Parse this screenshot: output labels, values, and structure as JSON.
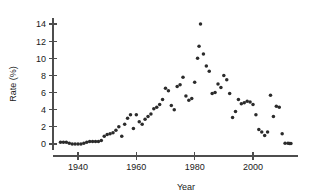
{
  "chart_data": {
    "type": "scatter",
    "title": "",
    "xlabel": "Year",
    "ylabel": "Rate (%)",
    "xlim": [
      1932,
      2014
    ],
    "ylim": [
      -0.6,
      14.6
    ],
    "xticks": [
      1940,
      1960,
      1980,
      2000
    ],
    "yticks": [
      0,
      2,
      4,
      6,
      8,
      10,
      12,
      14
    ],
    "grid": false,
    "legend": null,
    "marker": "filled-circle",
    "marker_color": "#2b2b2b",
    "series": [
      {
        "name": "Rate",
        "points": [
          [
            1934,
            0.2
          ],
          [
            1935,
            0.2
          ],
          [
            1936,
            0.2
          ],
          [
            1937,
            0.1
          ],
          [
            1938,
            0.0
          ],
          [
            1939,
            0.0
          ],
          [
            1940,
            0.0
          ],
          [
            1941,
            0.0
          ],
          [
            1942,
            0.1
          ],
          [
            1943,
            0.2
          ],
          [
            1944,
            0.3
          ],
          [
            1945,
            0.3
          ],
          [
            1946,
            0.3
          ],
          [
            1947,
            0.3
          ],
          [
            1948,
            0.4
          ],
          [
            1949,
            0.9
          ],
          [
            1950,
            1.1
          ],
          [
            1951,
            1.2
          ],
          [
            1952,
            1.3
          ],
          [
            1953,
            1.6
          ],
          [
            1954,
            2.0
          ],
          [
            1955,
            0.9
          ],
          [
            1956,
            2.3
          ],
          [
            1957,
            3.0
          ],
          [
            1958,
            3.4
          ],
          [
            1959,
            1.8
          ],
          [
            1960,
            3.4
          ],
          [
            1961,
            2.6
          ],
          [
            1962,
            2.3
          ],
          [
            1963,
            2.9
          ],
          [
            1964,
            3.2
          ],
          [
            1965,
            3.5
          ],
          [
            1966,
            4.1
          ],
          [
            1967,
            4.3
          ],
          [
            1968,
            4.6
          ],
          [
            1969,
            5.2
          ],
          [
            1970,
            6.5
          ],
          [
            1971,
            6.2
          ],
          [
            1972,
            4.5
          ],
          [
            1973,
            4.0
          ],
          [
            1974,
            6.7
          ],
          [
            1975,
            6.9
          ],
          [
            1976,
            7.8
          ],
          [
            1977,
            5.6
          ],
          [
            1978,
            5.1
          ],
          [
            1979,
            5.3
          ],
          [
            1980,
            7.2
          ],
          [
            1981,
            10.0
          ],
          [
            1981.5,
            11.4
          ],
          [
            1982,
            14.0
          ],
          [
            1983,
            10.5
          ],
          [
            1984,
            9.1
          ],
          [
            1985,
            8.5
          ],
          [
            1986,
            5.9
          ],
          [
            1987,
            6.0
          ],
          [
            1988,
            7.0
          ],
          [
            1989,
            6.6
          ],
          [
            1990,
            8.0
          ],
          [
            1991,
            7.5
          ],
          [
            1992,
            5.9
          ],
          [
            1993,
            3.1
          ],
          [
            1994,
            3.8
          ],
          [
            1995,
            5.2
          ],
          [
            1996,
            4.7
          ],
          [
            1997,
            4.8
          ],
          [
            1998,
            5.0
          ],
          [
            1999,
            4.9
          ],
          [
            2000,
            4.6
          ],
          [
            2001,
            3.4
          ],
          [
            2002,
            1.7
          ],
          [
            2003,
            1.4
          ],
          [
            2004,
            1.0
          ],
          [
            2005,
            1.4
          ],
          [
            2006,
            5.7
          ],
          [
            2007,
            3.2
          ],
          [
            2008,
            4.4
          ],
          [
            2009,
            4.3
          ],
          [
            2010,
            1.2
          ],
          [
            2011,
            0.1
          ],
          [
            2012,
            0.1
          ],
          [
            2012.5,
            0.05
          ],
          [
            2013,
            0.05
          ]
        ]
      }
    ]
  },
  "axes": {
    "y_title": "Rate (%)",
    "x_title": "Year",
    "y_tick_labels": [
      "0",
      "2",
      "4",
      "6",
      "8",
      "10",
      "12",
      "14"
    ],
    "x_tick_labels": [
      "1940",
      "1960",
      "1980",
      "2000"
    ]
  }
}
